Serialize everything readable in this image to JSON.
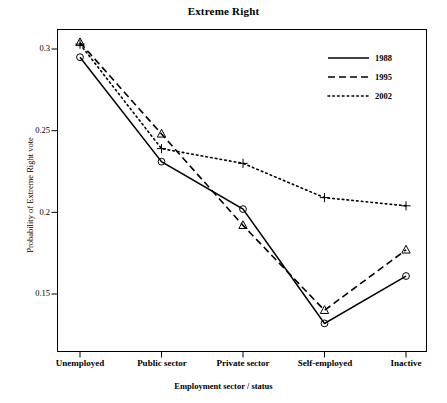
{
  "chart_data": {
    "type": "line",
    "title": "Extreme Right",
    "xlabel": "Employment sector / status",
    "ylabel": "Probability of Extreme Right vote",
    "categories": [
      "Unemployed",
      "Public sector",
      "Private sector",
      "Self-employed",
      "Inactive"
    ],
    "ylim": [
      0.125,
      0.312
    ],
    "yticks": [
      0.3,
      0.25,
      0.2,
      0.15
    ],
    "ytick_labels": [
      "0.3",
      "0.25",
      "0.2",
      "0.15"
    ],
    "grid": false,
    "legend_position": "top-right",
    "series": [
      {
        "name": "1988",
        "line_style": "solid",
        "marker": "circle",
        "values": [
          0.295,
          0.231,
          0.202,
          0.132,
          0.161
        ]
      },
      {
        "name": "1995",
        "line_style": "dashed",
        "marker": "triangle",
        "values": [
          0.304,
          0.248,
          0.192,
          0.14,
          0.177
        ]
      },
      {
        "name": "2002",
        "line_style": "dotted",
        "marker": "plus",
        "values": [
          0.303,
          0.239,
          0.23,
          0.209,
          0.204
        ]
      }
    ]
  },
  "axis": {
    "ytick_0": "0.3",
    "ytick_1": "0.25",
    "ytick_2": "0.2",
    "ytick_3": "0.15",
    "xtick_0": "Unemployed",
    "xtick_1": "Public sector",
    "xtick_2": "Private sector",
    "xtick_3": "Self-employed",
    "xtick_4": "Inactive"
  },
  "legend": {
    "entry_0": "1988",
    "entry_1": "1995",
    "entry_2": "2002"
  },
  "colors": {
    "foreground": "#000000",
    "background": "#ffffff"
  }
}
